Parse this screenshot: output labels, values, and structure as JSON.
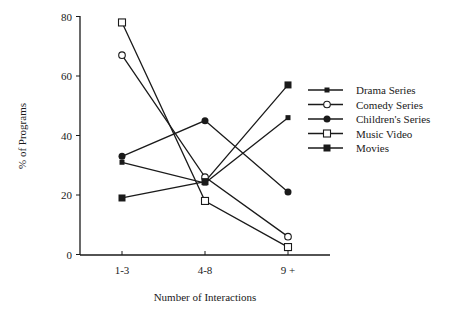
{
  "chart_data": {
    "type": "line",
    "title": "",
    "xlabel": "Number of Interactions",
    "ylabel": "% of Programs",
    "categories": [
      "1-3",
      "4-8",
      "9 +"
    ],
    "ylim": [
      0,
      80
    ],
    "yticks": [
      0,
      20,
      40,
      60,
      80
    ],
    "grid": false,
    "legend_position": "right",
    "series": [
      {
        "name": "Drama Series",
        "marker": "small-filled-square",
        "values": [
          31,
          24,
          46
        ]
      },
      {
        "name": "Comedy Series",
        "marker": "open-circle",
        "values": [
          67,
          26,
          6
        ]
      },
      {
        "name": "Children's Series",
        "marker": "filled-circle",
        "values": [
          33,
          45,
          21
        ]
      },
      {
        "name": "Music Video",
        "marker": "open-square",
        "values": [
          78,
          18,
          2.5
        ]
      },
      {
        "name": "Movies",
        "marker": "filled-square",
        "values": [
          19,
          24.5,
          57
        ]
      }
    ]
  },
  "axes": {
    "x_title": "Number of Interactions",
    "y_title": "% of Programs"
  },
  "legend": {
    "items": [
      "Drama Series",
      "Comedy Series",
      "Children's Series",
      "Music Video",
      "Movies"
    ]
  },
  "colors": {
    "line": "#1a1a1a",
    "background": "#ffffff"
  }
}
